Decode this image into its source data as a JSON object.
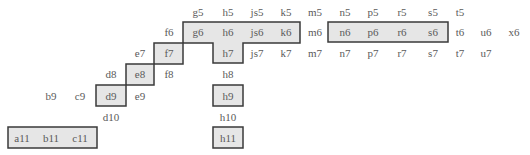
{
  "colors": {
    "box_fill": "#e6e6e6",
    "box_stroke": "#3a3a3a",
    "text": "#5a5a5a",
    "background": "#ffffff"
  },
  "rows": {
    "r5": [
      "g5",
      "h5",
      "js5",
      "k5",
      "m5",
      "n5",
      "p5",
      "r5",
      "s5",
      "t5"
    ],
    "r6": [
      "f6",
      "g6",
      "h6",
      "js6",
      "k6",
      "m6",
      "n6",
      "p6",
      "r6",
      "s6",
      "t6",
      "u6",
      "x6"
    ],
    "r7": [
      "e7",
      "f7",
      "h7",
      "js7",
      "k7",
      "m7",
      "n7",
      "p7",
      "r7",
      "s7",
      "t7",
      "u7"
    ],
    "r8": [
      "d8",
      "e8",
      "f8",
      "h8"
    ],
    "r9": [
      "b9",
      "c9",
      "d9",
      "e9",
      "h9"
    ],
    "r10": [
      "d10",
      "h10"
    ],
    "r11": [
      "a11",
      "b11",
      "c11",
      "h11"
    ]
  },
  "highlighted_groups": [
    [
      "g6",
      "h6",
      "js6",
      "k6",
      "h7"
    ],
    [
      "f7"
    ],
    [
      "e8"
    ],
    [
      "d9"
    ],
    [
      "n6",
      "p6",
      "r6",
      "s6"
    ],
    [
      "h9"
    ],
    [
      "h11"
    ],
    [
      "a11",
      "b11",
      "c11"
    ]
  ]
}
